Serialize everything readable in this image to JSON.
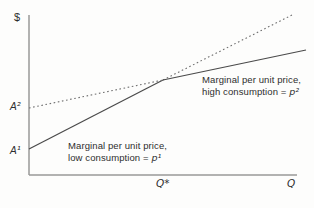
{
  "figure": {
    "y_axis_label": "$",
    "x_axis_label": "Q",
    "x_star_label": "Q*",
    "intercept_high_label": "A²",
    "intercept_low_label": "A¹",
    "annotation_high": {
      "line1": "Marginal per unit price,",
      "line2_text": "high consumption = ",
      "line2_var": "p²"
    },
    "annotation_low": {
      "line1": "Marginal per unit price,",
      "line2_text": "low consumption = ",
      "line2_var": "p¹"
    },
    "colors": {
      "solid_line": "#4a4a4a",
      "dotted_line": "#6e6e6e",
      "axis": "#999999",
      "text": "#2e2e2e",
      "background": "#fdfdfc"
    }
  },
  "geometry": {
    "width": 314,
    "height": 208,
    "axes": {
      "y_axis": {
        "x": 29,
        "y1": 15,
        "y2": 175
      },
      "x_axis": {
        "y": 175,
        "x1": 29,
        "x2": 297
      }
    },
    "segments": [
      {
        "name": "low-tariff-line-solid",
        "style": "solid",
        "x1": 29,
        "y1": 149,
        "x2": 163,
        "y2": 80
      },
      {
        "name": "low-tariff-line-dotted-ext",
        "style": "dotted",
        "x1": 163,
        "y1": 80,
        "x2": 292,
        "y2": 15
      },
      {
        "name": "high-tariff-line-dotted-ext",
        "style": "dotted",
        "x1": 29,
        "y1": 108,
        "x2": 163,
        "y2": 80
      },
      {
        "name": "high-tariff-line-solid",
        "style": "solid",
        "x1": 163,
        "y1": 80,
        "x2": 306,
        "y2": 50
      }
    ]
  },
  "chart_data": {
    "type": "line",
    "title": "",
    "xlabel": "Q",
    "ylabel": "$",
    "grid": false,
    "legend_position": "none",
    "axis_tick_labels": false,
    "xlim": [
      0,
      1
    ],
    "ylim": [
      0,
      1
    ],
    "x_markers": [
      {
        "label": "Q*",
        "x": 0.5
      }
    ],
    "y_intercept_markers": [
      {
        "label": "A¹",
        "y": 0.16
      },
      {
        "label": "A²",
        "y": 0.42
      }
    ],
    "intersection": {
      "x": 0.5,
      "y": 0.59
    },
    "series": [
      {
        "name": "Marginal per unit price, low consumption = p¹",
        "intercept_label": "A¹",
        "slope_label": "p¹",
        "x": [
          0,
          0.5,
          0.98
        ],
        "y": [
          0.16,
          0.59,
          1.0
        ],
        "line_style": "solid before Q*, dotted after Q*"
      },
      {
        "name": "Marginal per unit price, high consumption = p²",
        "intercept_label": "A²",
        "slope_label": "p²",
        "x": [
          0,
          0.5,
          1.03
        ],
        "y": [
          0.42,
          0.59,
          0.78
        ],
        "line_style": "dotted before Q*, solid after Q*"
      }
    ]
  }
}
